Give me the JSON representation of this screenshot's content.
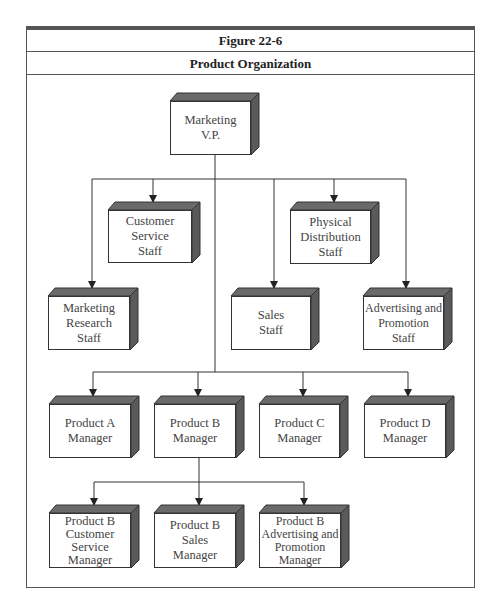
{
  "figure": {
    "number": "Figure 22-6",
    "title": "Product Organization"
  },
  "nodes": {
    "vp": "Marketing\nV.P.",
    "customer_service": "Customer\nService\nStaff",
    "physical_distribution": "Physical\nDistribution\nStaff",
    "marketing_research": "Marketing\nResearch\nStaff",
    "sales": "Sales\nStaff",
    "advertising": "Advertising and\nPromotion\nStaff",
    "product_a": "Product A\nManager",
    "product_b": "Product B\nManager",
    "product_c": "Product C\nManager",
    "product_d": "Product D\nManager",
    "pb_customer_service": "Product B\nCustomer\nService\nManager",
    "pb_sales": "Product B\nSales\nManager",
    "pb_advertising": "Product B\nAdvertising and\nPromotion\nManager"
  },
  "colors": {
    "box_side": "#555555",
    "box_top": "#666666",
    "line": "#333333"
  }
}
